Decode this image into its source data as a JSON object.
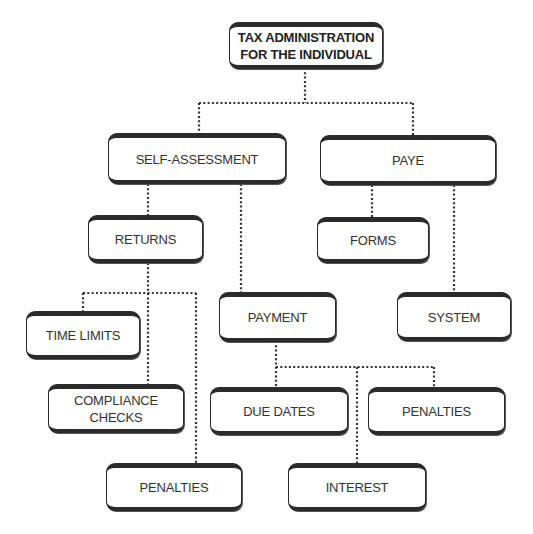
{
  "diagram": {
    "title": "TAX ADMINISTRATION FOR THE INDIVIDUAL",
    "root": {
      "line1": "TAX ADMINISTRATION",
      "line2": "FOR THE INDIVIDUAL"
    },
    "level1": {
      "self_assessment": "SELF-ASSESSMENT",
      "paye": "PAYE"
    },
    "self_assessment_children": {
      "returns": "RETURNS",
      "payment": "PAYMENT"
    },
    "paye_children": {
      "forms": "FORMS",
      "system": "SYSTEM"
    },
    "returns_children": {
      "time_limits": "TIME LIMITS",
      "compliance_checks": {
        "line1": "COMPLIANCE",
        "line2": "CHECKS"
      },
      "penalties": "PENALTIES"
    },
    "payment_children": {
      "due_dates": "DUE DATES",
      "penalties": "PENALTIES",
      "interest": "INTEREST"
    },
    "colors": {
      "border": "#2b2b2b",
      "text": "#333333",
      "connector": "#333333",
      "background": "#ffffff"
    }
  }
}
